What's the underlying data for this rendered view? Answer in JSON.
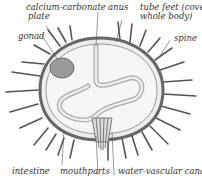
{
  "diagram": {
    "labels": {
      "calcium_carbonate_plate_line1": "calcium-carbonate",
      "calcium_carbonate_plate_line2": "plate",
      "gonad": "gonad",
      "anus": "anus",
      "tube_feet_line1": "tube feet (cover",
      "tube_feet_line2": "whole body)",
      "spine": "spine",
      "intestine": "intestine",
      "mouthparts": "mouthparts",
      "water_vascular_canal": "water-vascular canal"
    },
    "colors": {
      "text": "#333333",
      "line": "#555555",
      "body_fill": "#ededed",
      "shade": "#8a8a8a"
    }
  }
}
